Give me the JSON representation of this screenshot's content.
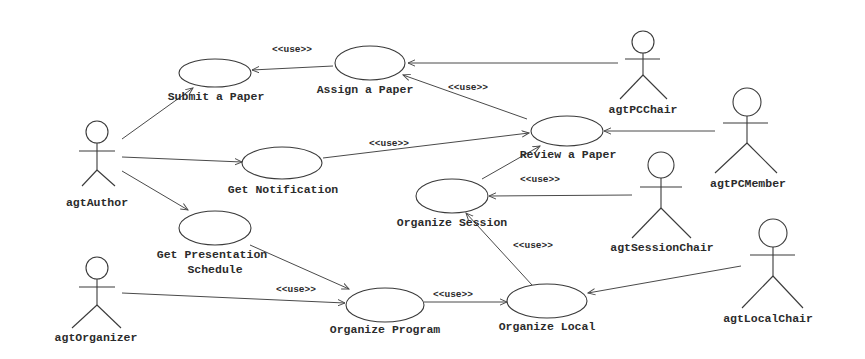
{
  "diagram": {
    "type": "UML use case diagram",
    "actors": [
      {
        "id": "author",
        "label": "agtAuthor"
      },
      {
        "id": "pcchair",
        "label": "agtPCChair"
      },
      {
        "id": "pcmember",
        "label": "agtPCMember"
      },
      {
        "id": "sessionchair",
        "label": "agtSessionChair"
      },
      {
        "id": "localchair",
        "label": "agtLocalChair"
      },
      {
        "id": "organizer",
        "label": "agtOrganizer"
      }
    ],
    "use_cases": [
      {
        "id": "submit",
        "label": "Submit a Paper"
      },
      {
        "id": "assign",
        "label": "Assign a Paper"
      },
      {
        "id": "review",
        "label": "Review a Paper"
      },
      {
        "id": "notify",
        "label": "Get Notification"
      },
      {
        "id": "session",
        "label": "Organize Session"
      },
      {
        "id": "schedule",
        "label_line1": "Get Presentation",
        "label_line2": "Schedule"
      },
      {
        "id": "program",
        "label": "Organize Program"
      },
      {
        "id": "local",
        "label": "Organize Local"
      }
    ],
    "stereotype": "<<use>>",
    "relations": [
      {
        "from": "agtAuthor",
        "to": "Submit a Paper",
        "stereotype": ""
      },
      {
        "from": "agtAuthor",
        "to": "Get Notification",
        "stereotype": ""
      },
      {
        "from": "agtAuthor",
        "to": "Get Presentation Schedule",
        "stereotype": ""
      },
      {
        "from": "Assign a Paper",
        "to": "Submit a Paper",
        "stereotype": "<<use>>"
      },
      {
        "from": "agtPCChair",
        "to": "Assign a Paper",
        "stereotype": ""
      },
      {
        "from": "Review a Paper",
        "to": "Assign a Paper",
        "stereotype": "<<use>>"
      },
      {
        "from": "Get Notification",
        "to": "Review a Paper",
        "stereotype": "<<use>>"
      },
      {
        "from": "agtPCMember",
        "to": "Review a Paper",
        "stereotype": ""
      },
      {
        "from": "Organize Session",
        "to": "Review a Paper",
        "stereotype": ""
      },
      {
        "from": "agtSessionChair",
        "to": "Organize Session",
        "stereotype": "<<use>>"
      },
      {
        "from": "Organize Local",
        "to": "Organize Session",
        "stereotype": "<<use>>"
      },
      {
        "from": "Get Presentation Schedule",
        "to": "Organize Program",
        "stereotype": ""
      },
      {
        "from": "agtOrganizer",
        "to": "Organize Program",
        "stereotype": "<<use>>"
      },
      {
        "from": "Organize Program",
        "to": "Organize Local",
        "stereotype": "<<use>>"
      },
      {
        "from": "agtLocalChair",
        "to": "Organize Local",
        "stereotype": ""
      }
    ]
  }
}
